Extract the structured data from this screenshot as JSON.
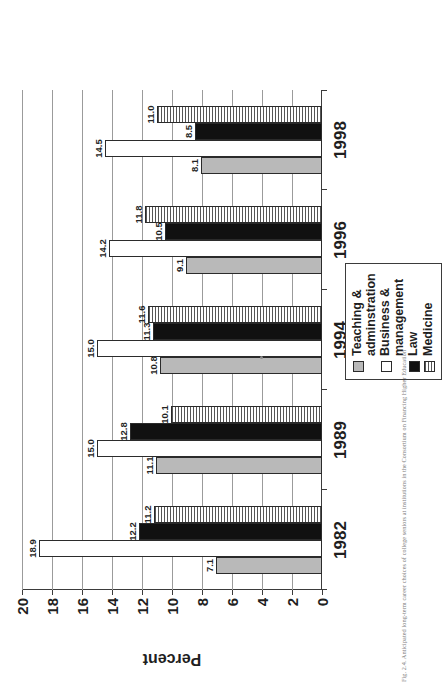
{
  "figure": {
    "caption": "Fig. 2.4. Anticipated long-term career choices of college seniors at institutions in the Consortium on Financing Higher Education"
  },
  "axis": {
    "value_axis_title": "Percent",
    "value_ticks": [
      "0",
      "2",
      "4",
      "6",
      "8",
      "10",
      "12",
      "14",
      "16",
      "18",
      "20"
    ],
    "category_ticks": [
      "1982",
      "1989",
      "1994",
      "1996",
      "1998"
    ]
  },
  "legend": {
    "items": [
      {
        "label": "Teaching &\nadminstration",
        "swatch": "solid-light-gray-swatch",
        "color": "#b9b9b9"
      },
      {
        "label": "Business &\nmanagement",
        "swatch": "white-swatch",
        "color": "#ffffff"
      },
      {
        "label": "Law",
        "swatch": "solid-black-swatch",
        "color": "#111111"
      },
      {
        "label": "Medicine",
        "swatch": "horizontal-hatch-swatch",
        "color": "#565656"
      }
    ]
  },
  "chart_data": {
    "type": "bar",
    "title": "",
    "xlabel": "",
    "ylabel": "Percent",
    "ylim": [
      0,
      20
    ],
    "grid": true,
    "orientation": "vertical-bars-printed-sideways",
    "legend_position": "bottom-right",
    "categories": [
      "1982",
      "1989",
      "1994",
      "1996",
      "1998"
    ],
    "series": [
      {
        "name": "Teaching & adminstration",
        "values": [
          7.1,
          11.1,
          10.8,
          9.1,
          8.1
        ]
      },
      {
        "name": "Business & management",
        "values": [
          18.9,
          15.0,
          15.0,
          14.2,
          14.5
        ]
      },
      {
        "name": "Law",
        "values": [
          12.2,
          12.8,
          11.3,
          10.5,
          8.5
        ]
      },
      {
        "name": "Medicine",
        "values": [
          11.2,
          10.1,
          11.6,
          11.8,
          11.0
        ]
      }
    ],
    "data_labels": [
      {
        "category": "1982",
        "series": "Teaching & adminstration",
        "value": "7.1"
      },
      {
        "category": "1982",
        "series": "Business & management",
        "value": "18.9"
      },
      {
        "category": "1982",
        "series": "Law",
        "value": "12.2"
      },
      {
        "category": "1982",
        "series": "Medicine",
        "value": "11.2"
      },
      {
        "category": "1989",
        "series": "Teaching & adminstration",
        "value": "11.1"
      },
      {
        "category": "1989",
        "series": "Business & management",
        "value": "15.0"
      },
      {
        "category": "1989",
        "series": "Law",
        "value": "12.8"
      },
      {
        "category": "1989",
        "series": "Medicine",
        "value": "10.1"
      },
      {
        "category": "1994",
        "series": "Teaching & adminstration",
        "value": "10.8"
      },
      {
        "category": "1994",
        "series": "Business & management",
        "value": "15.0"
      },
      {
        "category": "1994",
        "series": "Law",
        "value": "11.3"
      },
      {
        "category": "1994",
        "series": "Medicine",
        "value": "11.6"
      },
      {
        "category": "1996",
        "series": "Teaching & adminstration",
        "value": "9.1"
      },
      {
        "category": "1996",
        "series": "Business & management",
        "value": "14.2"
      },
      {
        "category": "1996",
        "series": "Law",
        "value": "10.5"
      },
      {
        "category": "1996",
        "series": "Medicine",
        "value": "11.8"
      },
      {
        "category": "1998",
        "series": "Teaching & adminstration",
        "value": "8.1"
      },
      {
        "category": "1998",
        "series": "Business & management",
        "value": "14.5"
      },
      {
        "category": "1998",
        "series": "Law",
        "value": "8.5"
      },
      {
        "category": "1998",
        "series": "Medicine",
        "value": "11.0"
      }
    ]
  }
}
